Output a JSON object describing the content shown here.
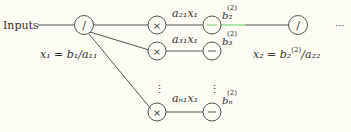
{
  "diagram": {
    "input_label": "Inputs",
    "nodes": {
      "div1": {
        "op": "/",
        "caption": "x₁ = b₁/a₁₁"
      },
      "mul2": {
        "op": "×",
        "edge_label": "a₂₁x₁"
      },
      "mul3": {
        "op": "×",
        "edge_label": "a₃₁x₁"
      },
      "muln": {
        "op": "×",
        "edge_label": "aₙ₁x₁"
      },
      "sub2": {
        "op": "−",
        "label": "b₂",
        "sup": "(2)"
      },
      "sub3": {
        "op": "−",
        "label": "b₃",
        "sup": "(2)"
      },
      "subn": {
        "op": "−",
        "label": "bₙ",
        "sup": "(2)"
      },
      "div2": {
        "op": "/",
        "caption": "x₂ = b₂",
        "caption_sup": "(2)",
        "caption_tail": "/a₂₂"
      }
    },
    "vdots": "⋮",
    "continuation": "···",
    "highlight_color": "#8fd88f",
    "line_color": "#555555"
  }
}
